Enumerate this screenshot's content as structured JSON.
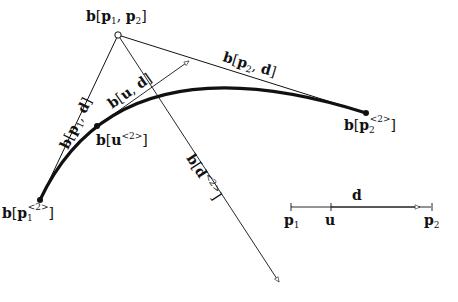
{
  "diagram": {
    "type": "bezier-blossom-construction",
    "colors": {
      "stroke": "#111111",
      "background": "#ffffff"
    },
    "labels": {
      "top_vertex": {
        "b": "b",
        "open": "[",
        "p1": "p",
        "p1_sub": "1",
        "comma": ", ",
        "p2": "p",
        "p2_sub": "2",
        "close": "]"
      },
      "left_edge": {
        "b": "b",
        "open": "[",
        "p": "p",
        "sub": "1",
        "comma": ", ",
        "d": "d",
        "close": "]"
      },
      "right_edge": {
        "b": "b",
        "open": "[",
        "p": "p",
        "sub": "2",
        "comma": ", ",
        "d": "d",
        "close": "]"
      },
      "u_d": {
        "b": "b",
        "open": "[",
        "u": "u",
        "comma": ", ",
        "d": "d",
        "close": "]"
      },
      "curve_u": {
        "b": "b",
        "open": "[",
        "u": "u",
        "sup": "<2>",
        "close": "]"
      },
      "curve_start": {
        "b": "b",
        "open": "[",
        "p": "p",
        "sub": "1",
        "sup": "<2>",
        "close": "]"
      },
      "curve_end": {
        "b": "b",
        "open": "[",
        "p": "p",
        "sub": "2",
        "sup": "<2>",
        "close": "]"
      },
      "derivative": {
        "b": "b",
        "open": "[",
        "d": "d",
        "sup": "<2>",
        "close": "]"
      }
    },
    "parameter_line": {
      "d_label": "d",
      "p1_label": "p",
      "p1_sub": "1",
      "u_label": "u",
      "p2_label": "p",
      "p2_sub": "2"
    }
  }
}
